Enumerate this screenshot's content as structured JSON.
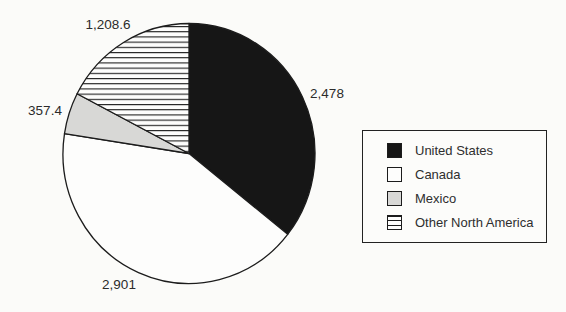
{
  "chart_data": {
    "type": "pie",
    "title": "",
    "direction": "clockwise",
    "start_angle_deg": 0,
    "legend_position": "right",
    "series": [
      {
        "name": "United States",
        "value": 2478,
        "data_label": "2,478",
        "fill": "#161616",
        "pattern": "solid"
      },
      {
        "name": "Canada",
        "value": 2901,
        "data_label": "2,901",
        "fill": "#fdfdfc",
        "pattern": "solid"
      },
      {
        "name": "Mexico",
        "value": 357.4,
        "data_label": "357.4",
        "fill": "#d8d8d6",
        "pattern": "solid"
      },
      {
        "name": "Other North America",
        "value": 1208.6,
        "data_label": "1,208.6",
        "fill": "#fdfdfc",
        "pattern": "horizontal-stripes"
      }
    ]
  },
  "colors": {
    "outline": "#1c1c1c",
    "background": "#fbfbf9",
    "text": "#2b2b2b"
  }
}
